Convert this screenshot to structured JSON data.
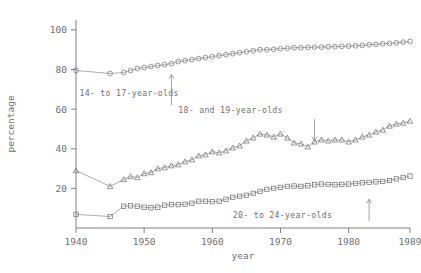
{
  "chart_data": {
    "type": "line",
    "title": "",
    "xlabel": "year",
    "ylabel": "percentage",
    "xlim": [
      1940,
      1989
    ],
    "ylim": [
      0,
      105
    ],
    "xticks": [
      1940,
      1950,
      1960,
      1970,
      1980,
      1989
    ],
    "xticklabels": [
      "1940",
      "1950",
      "1960",
      "1970",
      "1980",
      "1989"
    ],
    "yticks": [
      20,
      40,
      60,
      80,
      100
    ],
    "yticklabels": [
      "20",
      "40",
      "60",
      "80",
      "100"
    ],
    "grid": false,
    "legend_position": "inline-annotations",
    "series": [
      {
        "name": "14- to 17-year-olds",
        "marker": "circle",
        "label": "14- to 17-year-olds",
        "x": [
          1940,
          1945,
          1947,
          1948,
          1949,
          1950,
          1951,
          1952,
          1953,
          1954,
          1955,
          1956,
          1957,
          1958,
          1959,
          1960,
          1961,
          1962,
          1963,
          1964,
          1965,
          1966,
          1967,
          1968,
          1969,
          1970,
          1971,
          1972,
          1973,
          1974,
          1975,
          1976,
          1977,
          1978,
          1979,
          1980,
          1981,
          1982,
          1983,
          1984,
          1985,
          1986,
          1987,
          1988,
          1989
        ],
        "y": [
          79.5,
          78.0,
          78.5,
          79.5,
          80.5,
          81.0,
          81.5,
          82.0,
          82.5,
          83.0,
          84.0,
          84.5,
          85.0,
          85.5,
          86.0,
          86.5,
          87.0,
          87.5,
          88.0,
          88.5,
          89.0,
          89.5,
          90.0,
          90.0,
          90.2,
          90.5,
          90.7,
          91.0,
          91.0,
          91.2,
          91.3,
          91.3,
          91.5,
          91.5,
          91.7,
          91.8,
          92.0,
          92.2,
          92.5,
          92.7,
          93.0,
          93.2,
          93.5,
          93.8,
          94.2
        ]
      },
      {
        "name": "18- and 19-year-olds",
        "marker": "triangle",
        "label": "18- and 19-year-olds",
        "x": [
          1940,
          1945,
          1947,
          1948,
          1949,
          1950,
          1951,
          1952,
          1953,
          1954,
          1955,
          1956,
          1957,
          1958,
          1959,
          1960,
          1961,
          1962,
          1963,
          1964,
          1965,
          1966,
          1967,
          1968,
          1969,
          1970,
          1971,
          1972,
          1973,
          1974,
          1975,
          1976,
          1977,
          1978,
          1979,
          1980,
          1981,
          1982,
          1983,
          1984,
          1985,
          1986,
          1987,
          1988,
          1989
        ],
        "y": [
          29.0,
          21.0,
          24.5,
          26.0,
          25.5,
          27.5,
          28.0,
          30.0,
          30.5,
          31.5,
          32.0,
          33.5,
          34.5,
          36.5,
          37.0,
          38.5,
          38.0,
          39.0,
          40.5,
          41.5,
          44.0,
          45.5,
          47.5,
          47.0,
          46.0,
          47.5,
          45.5,
          43.0,
          42.5,
          41.0,
          43.5,
          44.5,
          44.0,
          44.5,
          44.5,
          43.5,
          44.5,
          46.0,
          47.0,
          48.5,
          49.5,
          51.5,
          52.5,
          53.0,
          54.0
        ]
      },
      {
        "name": "20- to 24-year-olds",
        "marker": "square",
        "label": "20- to 24-year-olds",
        "x": [
          1940,
          1945,
          1947,
          1948,
          1949,
          1950,
          1951,
          1952,
          1953,
          1954,
          1955,
          1956,
          1957,
          1958,
          1959,
          1960,
          1961,
          1962,
          1963,
          1964,
          1965,
          1966,
          1967,
          1968,
          1969,
          1970,
          1971,
          1972,
          1973,
          1974,
          1975,
          1976,
          1977,
          1978,
          1979,
          1980,
          1981,
          1982,
          1983,
          1984,
          1985,
          1986,
          1987,
          1988,
          1989
        ],
        "y": [
          6.9,
          5.8,
          11.0,
          11.2,
          11.0,
          10.5,
          10.2,
          10.5,
          11.5,
          11.8,
          11.8,
          12.0,
          12.5,
          13.5,
          13.5,
          13.3,
          13.5,
          14.5,
          15.5,
          16.0,
          16.5,
          17.5,
          18.5,
          19.5,
          20.0,
          20.5,
          21.0,
          21.2,
          21.0,
          21.3,
          21.8,
          22.2,
          22.0,
          21.8,
          22.0,
          22.2,
          22.5,
          22.8,
          23.0,
          23.3,
          23.5,
          24.0,
          24.8,
          25.5,
          26.2
        ]
      }
    ],
    "annotations": [
      {
        "text": "14- to 17-year-olds",
        "x": 1940.5,
        "y": 66.5,
        "arrow": "up",
        "arrow_x": 1954.0,
        "arrow_from_y": 62.0,
        "arrow_to_y": 77.5
      },
      {
        "text": "18- and 19-year-olds",
        "x": 1955.0,
        "y": 58.0,
        "arrow": "down",
        "arrow_x": 1975.0,
        "arrow_from_y": 55.0,
        "arrow_to_y": 44.0
      },
      {
        "text": "20- to 24-year-olds",
        "x": 1963.0,
        "y": 5.0,
        "arrow": "up",
        "arrow_x": 1983.0,
        "arrow_from_y": 3.5,
        "arrow_to_y": 14.5
      }
    ]
  },
  "colors": {
    "axis": "#808080",
    "text": "#6f6f6f",
    "line": "#8a8a8a",
    "marker": "#6b6b6b",
    "background": "#ffffff"
  }
}
